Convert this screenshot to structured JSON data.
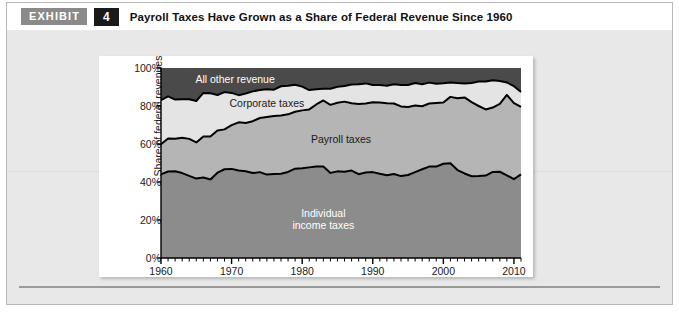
{
  "header": {
    "exhibit_label": "EXHIBIT",
    "exhibit_number": "4",
    "title": "Payroll Taxes Have Grown as a Share of Federal Revenue Since 1960"
  },
  "colors": {
    "exhibit_badge_bg": "#8a8a8a",
    "exhibit_number_bg": "#1a1a1a",
    "panel_bg": "#e8e8e8",
    "card_bg": "#ffffff",
    "individual_income_taxes": "#8c8c8c",
    "payroll_taxes": "#b5b5b5",
    "corporate_taxes": "#e4e4e4",
    "all_other_revenue": "#4a4a4a",
    "line": "#000000",
    "axis": "#000000"
  },
  "chart_data": {
    "type": "area",
    "stacked": true,
    "title": "Payroll Taxes Have Grown as a Share of Federal Revenue Since 1960",
    "xlabel": "",
    "ylabel": "Share of federal revenues",
    "xlim": [
      1960,
      2011
    ],
    "ylim": [
      0,
      100
    ],
    "grid": false,
    "legend_position": "inline-band-labels",
    "x_tick_labels": [
      "1960",
      "1970",
      "1980",
      "1990",
      "2000",
      "2010"
    ],
    "x_major_ticks": [
      1960,
      1970,
      1980,
      1990,
      2000,
      2010
    ],
    "x_minor_tick_interval": 1,
    "y_tick_labels": [
      "0%",
      "20%",
      "40%",
      "60%",
      "80%",
      "100%"
    ],
    "y_ticks": [
      0,
      20,
      40,
      60,
      80,
      100
    ],
    "x": [
      1960,
      1961,
      1962,
      1963,
      1964,
      1965,
      1966,
      1967,
      1968,
      1969,
      1970,
      1971,
      1972,
      1973,
      1974,
      1975,
      1976,
      1977,
      1978,
      1979,
      1980,
      1981,
      1982,
      1983,
      1984,
      1985,
      1986,
      1987,
      1988,
      1989,
      1990,
      1991,
      1992,
      1993,
      1994,
      1995,
      1996,
      1997,
      1998,
      1999,
      2000,
      2001,
      2002,
      2003,
      2004,
      2005,
      2006,
      2007,
      2008,
      2009,
      2010,
      2011
    ],
    "series": [
      {
        "name": "Individual income taxes",
        "label": "Individual\nincome taxes",
        "label_line1": "Individual",
        "label_line2": "income taxes",
        "color": "#8c8c8c",
        "label_color": "#ffffff",
        "values": [
          44.0,
          45.5,
          45.7,
          44.7,
          43.2,
          41.8,
          42.4,
          41.3,
          44.9,
          46.7,
          46.9,
          46.1,
          45.7,
          44.7,
          45.2,
          43.9,
          44.2,
          44.3,
          45.3,
          47.0,
          47.2,
          47.7,
          48.2,
          48.1,
          44.8,
          45.6,
          45.4,
          46.0,
          44.1,
          45.0,
          45.2,
          44.3,
          43.6,
          44.2,
          43.1,
          43.7,
          45.2,
          46.7,
          48.1,
          48.1,
          49.6,
          49.9,
          46.3,
          44.5,
          43.0,
          43.1,
          43.4,
          45.3,
          45.4,
          43.5,
          41.5,
          44.0
        ]
      },
      {
        "name": "Payroll taxes",
        "label": "Payroll taxes",
        "color": "#b5b5b5",
        "label_color": "#1a1a1a",
        "values": [
          15.9,
          17.4,
          17.1,
          18.6,
          19.5,
          19.0,
          21.5,
          22.6,
          22.2,
          21.0,
          23.0,
          25.3,
          25.4,
          27.3,
          28.5,
          30.3,
          30.5,
          30.7,
          30.3,
          30.0,
          30.5,
          30.5,
          32.6,
          34.8,
          35.8,
          36.1,
          36.9,
          35.5,
          37.0,
          36.3,
          36.8,
          37.5,
          37.9,
          37.1,
          36.7,
          35.8,
          35.1,
          33.2,
          33.2,
          33.5,
          32.2,
          34.9,
          37.8,
          40.0,
          39.0,
          36.9,
          34.8,
          33.9,
          35.7,
          42.3,
          40.0,
          35.5
        ]
      },
      {
        "name": "Corporate taxes",
        "label": "Corporate taxes",
        "color": "#e4e4e4",
        "label_color": "#1a1a1a",
        "values": [
          23.2,
          22.2,
          20.6,
          20.3,
          20.9,
          21.8,
          23.0,
          22.8,
          18.7,
          19.6,
          17.0,
          14.3,
          15.5,
          15.7,
          14.7,
          14.6,
          13.9,
          15.4,
          15.0,
          14.2,
          12.5,
          10.2,
          8.0,
          6.2,
          8.5,
          8.4,
          8.2,
          9.8,
          10.4,
          10.6,
          9.1,
          9.3,
          9.2,
          10.2,
          11.2,
          11.6,
          11.8,
          11.5,
          11.0,
          10.1,
          10.2,
          7.6,
          8.0,
          7.4,
          10.1,
          12.9,
          14.7,
          14.4,
          12.1,
          6.6,
          8.9,
          7.9
        ]
      },
      {
        "name": "All other revenue",
        "label": "All other revenue",
        "color": "#4a4a4a",
        "label_color": "#ffffff",
        "values": [
          16.9,
          14.9,
          16.6,
          16.4,
          16.4,
          17.4,
          13.1,
          13.3,
          14.2,
          12.7,
          13.1,
          14.3,
          13.4,
          12.3,
          11.6,
          11.2,
          11.4,
          9.6,
          9.4,
          8.8,
          9.8,
          11.6,
          11.2,
          10.9,
          10.9,
          9.9,
          9.5,
          8.7,
          8.5,
          8.1,
          8.9,
          8.9,
          9.3,
          8.5,
          9.0,
          8.9,
          7.9,
          8.6,
          7.7,
          8.3,
          8.0,
          7.6,
          7.9,
          8.1,
          7.9,
          7.1,
          7.1,
          6.4,
          6.8,
          7.6,
          9.6,
          12.6
        ]
      }
    ],
    "cumulative_boundaries_note": "Bands are stacked bottom-to-top: individual income taxes, payroll taxes, corporate taxes, all other revenue; totals 100%."
  }
}
